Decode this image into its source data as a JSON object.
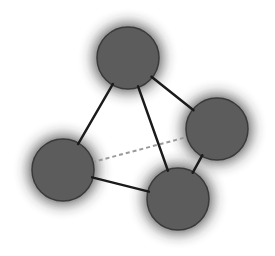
{
  "diagram": {
    "type": "tetrahedral-graph",
    "background": "#ffffff",
    "node_fill": "#5c5c5c",
    "node_stroke": "#3a3a3a",
    "halo_color": "#2a2a2a",
    "edge_color": "#1a1a1a",
    "hidden_edge_color": "#9a9a9a",
    "nodes": [
      {
        "id": "top",
        "cx": 128,
        "cy": 58,
        "r": 31
      },
      {
        "id": "right",
        "cx": 217,
        "cy": 129,
        "r": 31
      },
      {
        "id": "left",
        "cx": 63,
        "cy": 170,
        "r": 31
      },
      {
        "id": "bottom",
        "cx": 178,
        "cy": 199,
        "r": 31
      }
    ],
    "edges": [
      {
        "from": "top",
        "to": "left",
        "style": "solid"
      },
      {
        "from": "top",
        "to": "right",
        "style": "solid"
      },
      {
        "from": "top",
        "to": "bottom",
        "style": "solid"
      },
      {
        "from": "left",
        "to": "bottom",
        "style": "solid"
      },
      {
        "from": "right",
        "to": "bottom",
        "style": "solid"
      },
      {
        "from": "left",
        "to": "right",
        "style": "dashed"
      }
    ]
  }
}
